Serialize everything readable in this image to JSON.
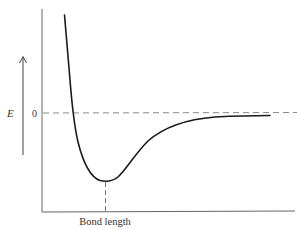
{
  "diagram": {
    "y_axis_label": "E",
    "zero_label": "0",
    "x_axis_label": "Bond length",
    "colors": {
      "curve": "#1a1a1a",
      "axis": "#555555",
      "dashed": "#777777",
      "text": "#333333"
    },
    "elements": {
      "energy_arrow": "up-arrow-icon",
      "zero_line": "dashed horizontal line at E = 0 (dissociation asymptote)",
      "equilibrium_marker": "dashed vertical line from curve minimum to x-axis"
    }
  }
}
